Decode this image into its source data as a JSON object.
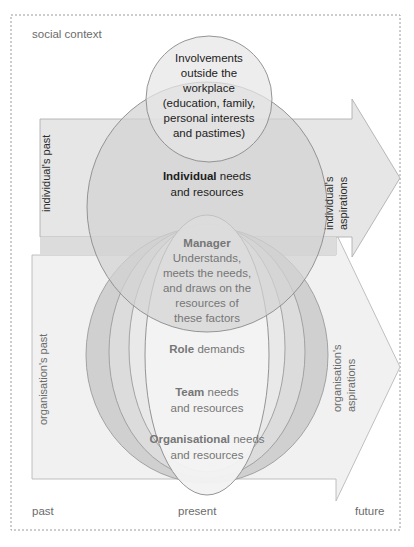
{
  "diagram": {
    "title": "social context",
    "corner_labels": {
      "social_context": "social context",
      "past": "past",
      "present": "present",
      "future": "future"
    },
    "bands": [
      {
        "id": "individual",
        "past_label": "individual's past",
        "aspirations_label": "individual's aspirations"
      },
      {
        "id": "organisation",
        "past_label": "organisation's past",
        "aspirations_label": "organisation's aspirations"
      }
    ],
    "circles": [
      {
        "id": "involvements",
        "lines": [
          "Involvements",
          "outside the",
          "workplace",
          "(education, family,",
          "personal interests",
          "and pastimes)"
        ],
        "bold_lead": "",
        "color": "#e3e3e3"
      },
      {
        "id": "individual",
        "bold_lead": "Individual",
        "lines": [
          "Individual needs",
          "and resources"
        ],
        "rest_first_line": " needs",
        "color": "#d4d4d4"
      },
      {
        "id": "manager",
        "bold_lead": "Manager",
        "lines": [
          "Manager",
          "Understands,",
          "meets the needs,",
          "and draws on the",
          "resources of",
          "these factors"
        ],
        "color": "#efefef"
      },
      {
        "id": "role",
        "bold_lead": "Role",
        "lines": [
          "Role demands"
        ],
        "rest_first_line": " demands",
        "color": "#f4f4f4"
      },
      {
        "id": "team",
        "bold_lead": "Team",
        "lines": [
          "Team needs",
          "and resources"
        ],
        "rest_first_line": " needs",
        "color": "#e0e0e0"
      },
      {
        "id": "organisational",
        "bold_lead": "Organisational",
        "lines": [
          "Organisational needs",
          "and resources"
        ],
        "rest_first_line": " needs",
        "color": "#cfcfcf"
      }
    ],
    "colors": {
      "border_dotted": "#9a9a9a",
      "band_individual": "#e8e8e8",
      "band_organisation": "#f0f0f0",
      "band_overlap": "#c9c9c9",
      "outline": "#8c8c8c",
      "text_dark": "#1c1c1c",
      "text_grey": "#767676",
      "background": "#ffffff"
    },
    "text": {
      "involvements_l1": "Involvements",
      "involvements_l2": "outside the",
      "involvements_l3": "workplace",
      "involvements_l4": "(education, family,",
      "involvements_l5": "personal interests",
      "involvements_l6": "and pastimes)",
      "individual_b": "Individual",
      "individual_r": " needs",
      "individual_l2": "and resources",
      "manager_b": "Manager",
      "manager_l2": "Understands,",
      "manager_l3": "meets the needs,",
      "manager_l4": "and draws on the",
      "manager_l5": "resources of",
      "manager_l6": "these factors",
      "role_b": "Role",
      "role_r": " demands",
      "team_b": "Team",
      "team_r": " needs",
      "team_l2": "and resources",
      "org_b": "Organisational",
      "org_r": " needs",
      "org_l2": "and resources"
    }
  }
}
